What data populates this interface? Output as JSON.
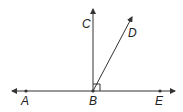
{
  "diagram": {
    "points": {
      "A": {
        "label": "A"
      },
      "B": {
        "label": "B"
      },
      "C": {
        "label": "C"
      },
      "D": {
        "label": "D"
      },
      "E": {
        "label": "E"
      }
    },
    "colors": {
      "stroke": "#333333"
    }
  }
}
